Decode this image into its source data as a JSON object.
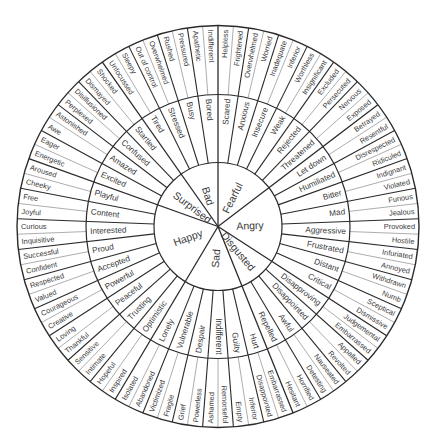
{
  "geometry": {
    "center": [
      218,
      226.5
    ],
    "r_inner": 64,
    "r_middle": 132,
    "r_outer": 201,
    "start_angle_deg": -90
  },
  "colors": {
    "line": "#2b2b2b",
    "thin_line": "#8a8a8a",
    "text": "#3a3a3a",
    "background": "#ffffff"
  },
  "wheel": [
    {
      "core": "Fearful",
      "children": [
        {
          "label": "Scared",
          "outer": [
            "Helpless",
            "Frightened"
          ]
        },
        {
          "label": "Anxious",
          "outer": [
            "Overwhelmed",
            "Worried"
          ]
        },
        {
          "label": "Insecure",
          "outer": [
            "Inadequate",
            "Inferior"
          ]
        },
        {
          "label": "Weak",
          "outer": [
            "Worthless",
            "Insignificant"
          ]
        },
        {
          "label": "Rejected",
          "outer": [
            "Excluded",
            "Persecuted"
          ]
        },
        {
          "label": "Threatened",
          "outer": [
            "Nervous",
            "Exposed"
          ]
        }
      ]
    },
    {
      "core": "Angry",
      "children": [
        {
          "label": "Let down",
          "outer": [
            "Betrayed",
            "Resentful"
          ]
        },
        {
          "label": "Humiliated",
          "outer": [
            "Disrespected",
            "Ridiculed"
          ]
        },
        {
          "label": "Bitter",
          "outer": [
            "Indignant",
            "Violated"
          ]
        },
        {
          "label": "Mad",
          "outer": [
            "Furious",
            "Jealous"
          ]
        },
        {
          "label": "Aggressive",
          "outer": [
            "Provoked",
            "Hostile"
          ]
        },
        {
          "label": "Frustrated",
          "outer": [
            "Infuriated",
            "Annoyed"
          ]
        },
        {
          "label": "Distant",
          "outer": [
            "Withdrawn",
            "Numb"
          ]
        },
        {
          "label": "Critical",
          "outer": [
            "Sceptical",
            "Dismissive"
          ]
        }
      ]
    },
    {
      "core": "Disgusted",
      "children": [
        {
          "label": "Disapproving",
          "outer": [
            "Judgemental",
            "Embarrassed"
          ]
        },
        {
          "label": "Disappointed",
          "outer": [
            "Appalled",
            "Revolted"
          ]
        },
        {
          "label": "Awful",
          "outer": [
            "Nauseated",
            "Detesting"
          ]
        },
        {
          "label": "Repelled",
          "outer": [
            "Horrified",
            "Hesitant"
          ]
        }
      ]
    },
    {
      "core": "Sad",
      "children": [
        {
          "label": "Hurt",
          "outer": [
            "Embarrassed",
            "Disappointed"
          ]
        },
        {
          "label": "Guilty",
          "outer": [
            "Inferior",
            "Empty"
          ]
        },
        {
          "label": "Indifferent",
          "outer": [
            "Remorseful",
            "Ashamed"
          ]
        },
        {
          "label": "Despair",
          "outer": [
            "Powerless",
            "Grief"
          ]
        },
        {
          "label": "Vulnerable",
          "outer": [
            "Fragile",
            "Victimized"
          ]
        },
        {
          "label": "Lonely",
          "outer": [
            "Abandoned",
            "Isolated"
          ]
        }
      ]
    },
    {
      "core": "Happy",
      "children": [
        {
          "label": "Optimistic",
          "outer": [
            "Inspired",
            "Hopeful"
          ]
        },
        {
          "label": "Trusting",
          "outer": [
            "Intimate",
            "Sensitive"
          ]
        },
        {
          "label": "Peaceful",
          "outer": [
            "Thankful",
            "Loving"
          ]
        },
        {
          "label": "Powerful",
          "outer": [
            "Creative",
            "Courageous"
          ]
        },
        {
          "label": "Accepted",
          "outer": [
            "Valued",
            "Respected"
          ]
        },
        {
          "label": "Proud",
          "outer": [
            "Confident",
            "Successful"
          ]
        },
        {
          "label": "Interested",
          "outer": [
            "Inquisitive",
            "Curious"
          ]
        },
        {
          "label": "Content",
          "outer": [
            "Joyful",
            "Free"
          ]
        },
        {
          "label": "Playful",
          "outer": [
            "Cheeky",
            "Aroused"
          ]
        }
      ]
    },
    {
      "core": "Surprised",
      "children": [
        {
          "label": "Excited",
          "outer": [
            "Energetic",
            "Eager"
          ]
        },
        {
          "label": "Amazed",
          "outer": [
            "Awe",
            "Astonished"
          ]
        },
        {
          "label": "Confused",
          "outer": [
            "Perplexed",
            "Disillusioned"
          ]
        },
        {
          "label": "Startled",
          "outer": [
            "Dismayed",
            "Shocked"
          ]
        }
      ]
    },
    {
      "core": "Bad",
      "children": [
        {
          "label": "Tired",
          "outer": [
            "Unfocussed",
            "Sleepy"
          ]
        },
        {
          "label": "Stressed",
          "outer": [
            "Out of control",
            "Overwhelmed"
          ]
        },
        {
          "label": "Busy",
          "outer": [
            "Rushed",
            "Pressured"
          ]
        },
        {
          "label": "Bored",
          "outer": [
            "Apathetic",
            "Indifferent"
          ]
        }
      ]
    }
  ]
}
